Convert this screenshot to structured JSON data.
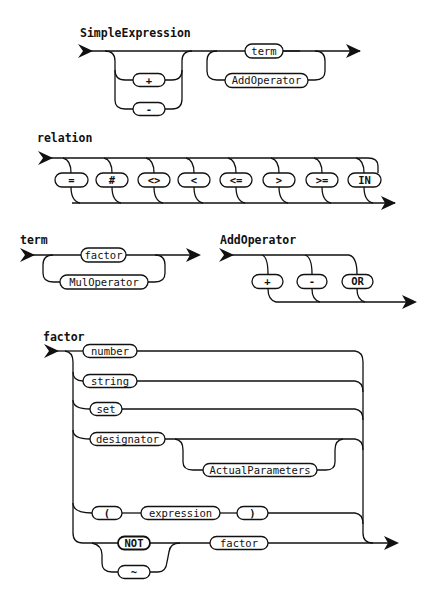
{
  "diagrams": {
    "simple_expression": {
      "title": "SimpleExpression",
      "sign_options": [
        "+",
        "-"
      ],
      "body": [
        "term",
        "AddOperator"
      ]
    },
    "relation": {
      "title": "relation",
      "options": [
        "=",
        "#",
        "<>",
        "<",
        "<=",
        ">",
        ">=",
        "IN"
      ]
    },
    "term": {
      "title": "term",
      "body": [
        "factor",
        "MulOperator"
      ]
    },
    "add_operator": {
      "title": "AddOperator",
      "options": [
        "+",
        "-",
        "OR"
      ]
    },
    "factor": {
      "title": "factor",
      "alternatives": {
        "number": "number",
        "string": "string",
        "set": "set",
        "designator": "designator",
        "actual_parameters": "ActualParameters",
        "open_paren": "(",
        "expression": "expression",
        "close_paren": ")",
        "not": "NOT",
        "tilde": "~",
        "factor": "factor"
      }
    }
  },
  "colors": {
    "stroke": "#111111",
    "background": "#ffffff"
  }
}
